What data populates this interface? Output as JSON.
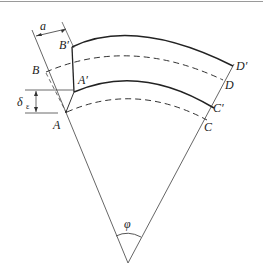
{
  "diagram": {
    "type": "geometric-sector",
    "labels": {
      "a": "a",
      "B_prime": "B′",
      "B": "B",
      "A_prime": "A′",
      "A": "A",
      "delta": "δ",
      "delta_sub": "ε",
      "D_prime": "D′",
      "D": "D",
      "C_prime": "C′",
      "C": "C",
      "phi": "φ"
    },
    "colors": {
      "line": "#222222",
      "thin_line": "#555555",
      "border": "#9a9a9a",
      "background": "#ffffff"
    }
  }
}
